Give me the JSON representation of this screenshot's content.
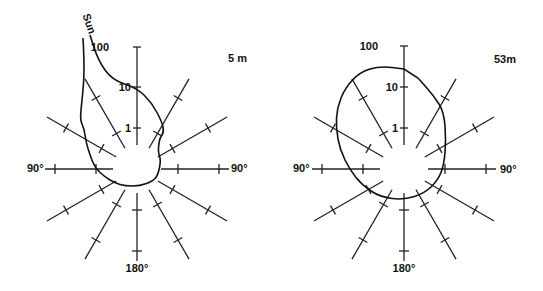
{
  "chart_data": [
    {
      "type": "polar",
      "title": "5 m",
      "center": [
        137,
        169
      ],
      "radial_scale": "log",
      "radial_tick_labels": [
        "1",
        "10",
        "100"
      ],
      "radial_tick_radii_px": [
        41,
        82,
        122
      ],
      "spoke_angles_deg": [
        0,
        30,
        60,
        90,
        120,
        150,
        180,
        210,
        240,
        270,
        300,
        330
      ],
      "angle_labels": {
        "left": "90°",
        "right": "90°",
        "bottom": "180°"
      },
      "annotation": "Sun",
      "outline_points": [
        [
          90,
          35
        ],
        [
          98,
          60
        ],
        [
          112,
          80
        ],
        [
          137,
          88
        ],
        [
          152,
          103
        ],
        [
          162,
          122
        ],
        [
          164,
          132
        ],
        [
          160,
          138
        ],
        [
          159,
          143
        ],
        [
          158,
          152
        ],
        [
          161,
          160
        ],
        [
          158,
          175
        ],
        [
          153,
          181
        ],
        [
          140,
          186
        ],
        [
          125,
          186
        ],
        [
          115,
          183
        ],
        [
          105,
          177
        ],
        [
          95,
          168
        ],
        [
          90,
          155
        ],
        [
          86,
          142
        ],
        [
          84,
          128
        ],
        [
          80,
          120
        ],
        [
          82,
          100
        ],
        [
          84,
          80
        ],
        [
          84,
          58
        ],
        [
          83,
          38
        ]
      ]
    },
    {
      "type": "polar",
      "title": "53m",
      "center": [
        404,
        169
      ],
      "radial_scale": "log",
      "radial_tick_labels": [
        "1",
        "10",
        "100"
      ],
      "radial_tick_radii_px": [
        41,
        82,
        123
      ],
      "spoke_angles_deg": [
        0,
        30,
        60,
        90,
        120,
        150,
        180,
        210,
        240,
        270,
        300,
        330
      ],
      "angle_labels": {
        "left": "90°",
        "right": "90°",
        "bottom": "180°"
      },
      "outline_points": [
        [
          404,
          69
        ],
        [
          380,
          66
        ],
        [
          360,
          72
        ],
        [
          345,
          88
        ],
        [
          337,
          108
        ],
        [
          336,
          128
        ],
        [
          340,
          150
        ],
        [
          350,
          170
        ],
        [
          362,
          185
        ],
        [
          380,
          197
        ],
        [
          404,
          200
        ],
        [
          425,
          193
        ],
        [
          438,
          180
        ],
        [
          444,
          165
        ],
        [
          446,
          140
        ],
        [
          444,
          112
        ],
        [
          434,
          96
        ],
        [
          418,
          78
        ]
      ]
    }
  ],
  "labels": {
    "left_title": "5 m",
    "right_title": "53m",
    "sun": "Sun",
    "tick_100": "100",
    "tick_10": "10",
    "tick_1": "1",
    "deg_90": "90°",
    "deg_180": "180°"
  }
}
